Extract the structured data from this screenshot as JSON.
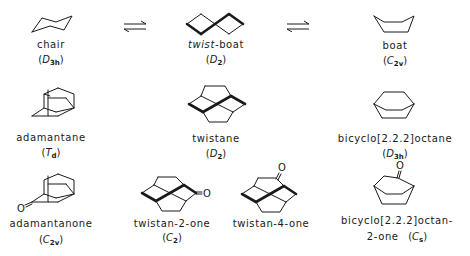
{
  "equilibrium_arrows": [
    {
      "symbol": "⇌"
    },
    {
      "symbol": "⇌"
    }
  ],
  "molecules": {
    "chair": {
      "name": "chair",
      "sym_letter": "D",
      "sym_sub": "3h"
    },
    "twist_boat": {
      "name_italic": "twist",
      "name_rest": "-boat",
      "sym_letter": "D",
      "sym_sub": "2"
    },
    "boat": {
      "name": "boat",
      "sym_letter": "C",
      "sym_sub": "2v"
    },
    "adamantane": {
      "name": "adamantane",
      "sym_letter": "T",
      "sym_sub": "d"
    },
    "twistane": {
      "name": "twistane",
      "sym_letter": "D",
      "sym_sub": "2"
    },
    "bicyclooctane": {
      "name": "bicyclo[2.2.2]octane",
      "sym_letter": "D",
      "sym_sub": "3h"
    },
    "adamantanone": {
      "name": "adamantanone",
      "sym_letter": "C",
      "sym_sub": "2v",
      "oxygen": "O"
    },
    "twistan_2_one": {
      "name": "twistan-2-one",
      "sym_letter": "C",
      "sym_sub": "2",
      "oxygen": "O"
    },
    "twistan_4_one": {
      "name": "twistan-4-one",
      "oxygen": "O"
    },
    "bicyclooctanone": {
      "name_line1": "bicyclo[2.2.2]octan-",
      "name_line2": "2-one",
      "sym_letter": "C",
      "sym_sub": "s",
      "oxygen": "O"
    }
  },
  "open": "(",
  "close": ")"
}
